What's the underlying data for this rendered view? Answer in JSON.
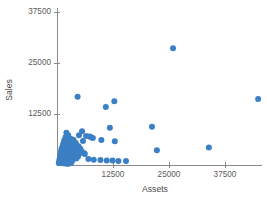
{
  "chart_data": {
    "type": "scatter",
    "title": "",
    "xlabel": "Assets",
    "ylabel": "Sales",
    "xlim": [
      0,
      56000
    ],
    "ylim": [
      0,
      54000
    ],
    "xticks": [
      12500,
      25000,
      37500,
      50000
    ],
    "xtick_labels": [
      "12500",
      "25000",
      "37500",
      "50000"
    ],
    "yticks": [
      12500,
      25000,
      37500,
      50000
    ],
    "ytick_labels": [
      "12500",
      "25000",
      "37500",
      "50000"
    ],
    "grid": false,
    "legend": null,
    "marker_color": "#3b7fc4",
    "axis_color": "#8a8a8a",
    "text_color": "#5a5a5a",
    "marker_size": 3.0,
    "series": [
      {
        "name": "Companies",
        "points": [
          [
            51800,
            50100
          ],
          [
            25900,
            28600
          ],
          [
            44900,
            16200
          ],
          [
            4600,
            16700
          ],
          [
            12800,
            15600
          ],
          [
            10900,
            14200
          ],
          [
            21200,
            9400
          ],
          [
            11800,
            9100
          ],
          [
            5600,
            8300
          ],
          [
            4900,
            7300
          ],
          [
            6500,
            7100
          ],
          [
            7300,
            7000
          ],
          [
            7600,
            6800
          ],
          [
            8000,
            6600
          ],
          [
            9900,
            6100
          ],
          [
            12900,
            5800
          ],
          [
            33900,
            4300
          ],
          [
            22300,
            3600
          ],
          [
            2100,
            7900
          ],
          [
            2500,
            7300
          ],
          [
            1900,
            6800
          ],
          [
            2800,
            6500
          ],
          [
            3300,
            6300
          ],
          [
            3700,
            6100
          ],
          [
            1600,
            6000
          ],
          [
            2200,
            5700
          ],
          [
            2900,
            5500
          ],
          [
            4200,
            5400
          ],
          [
            1400,
            5200
          ],
          [
            1800,
            5000
          ],
          [
            2400,
            4900
          ],
          [
            3100,
            4800
          ],
          [
            3900,
            4700
          ],
          [
            4800,
            4600
          ],
          [
            1200,
            4500
          ],
          [
            1700,
            4400
          ],
          [
            2300,
            4300
          ],
          [
            2900,
            4200
          ],
          [
            3500,
            4100
          ],
          [
            4300,
            4000
          ],
          [
            5200,
            4000
          ],
          [
            1000,
            3900
          ],
          [
            1500,
            3800
          ],
          [
            2000,
            3700
          ],
          [
            2600,
            3600
          ],
          [
            3200,
            3500
          ],
          [
            3800,
            3500
          ],
          [
            4500,
            3400
          ],
          [
            5500,
            3400
          ],
          [
            900,
            3300
          ],
          [
            1300,
            3200
          ],
          [
            1800,
            3100
          ],
          [
            2400,
            3000
          ],
          [
            3000,
            3000
          ],
          [
            3600,
            2900
          ],
          [
            4200,
            2800
          ],
          [
            5000,
            2800
          ],
          [
            6200,
            2700
          ],
          [
            800,
            2600
          ],
          [
            1200,
            2500
          ],
          [
            1600,
            2500
          ],
          [
            2100,
            2400
          ],
          [
            2700,
            2300
          ],
          [
            3300,
            2300
          ],
          [
            4000,
            2200
          ],
          [
            4700,
            2100
          ],
          [
            700,
            2000
          ],
          [
            1100,
            2000
          ],
          [
            1500,
            1900
          ],
          [
            1900,
            1800
          ],
          [
            2400,
            1800
          ],
          [
            3000,
            1700
          ],
          [
            3600,
            1600
          ],
          [
            4300,
            1600
          ],
          [
            600,
            1500
          ],
          [
            1000,
            1400
          ],
          [
            1400,
            1400
          ],
          [
            1800,
            1300
          ],
          [
            2300,
            1200
          ],
          [
            2800,
            1200
          ],
          [
            3400,
            1100
          ],
          [
            500,
            1000
          ],
          [
            900,
            900
          ],
          [
            1300,
            900
          ],
          [
            1700,
            800
          ],
          [
            2200,
            800
          ],
          [
            2700,
            700
          ],
          [
            3200,
            600
          ],
          [
            400,
            500
          ],
          [
            800,
            500
          ],
          [
            1200,
            400
          ],
          [
            1600,
            400
          ],
          [
            2100,
            300
          ],
          [
            2600,
            300
          ],
          [
            9700,
            1200
          ],
          [
            11100,
            1100
          ],
          [
            12400,
            1100
          ],
          [
            13700,
            1000
          ],
          [
            15400,
            1000
          ],
          [
            8200,
            1300
          ],
          [
            7000,
            1500
          ],
          [
            6100,
            2900
          ],
          [
            5800,
            5900
          ]
        ]
      }
    ]
  }
}
